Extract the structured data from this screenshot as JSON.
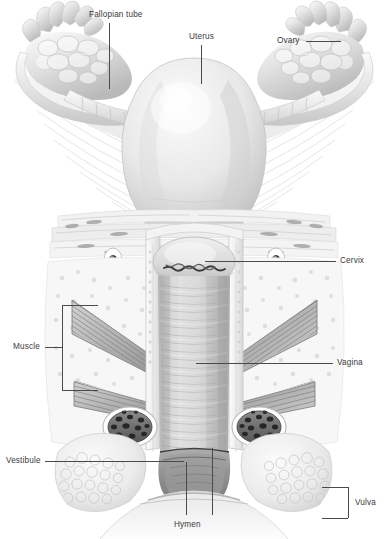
{
  "figure": {
    "style": "grayscale medical illustration",
    "background_color": "#ffffff",
    "label_color": "#3a3a3a",
    "leader_color": "#4a4a4a",
    "width": 389,
    "height": 539
  },
  "labels": [
    {
      "id": "fallopian-tube",
      "text": "Fallopian tube",
      "x": 89,
      "y": 11,
      "anchor": "left",
      "leader": "vertical-down"
    },
    {
      "id": "uterus",
      "text": "Uterus",
      "x": 189,
      "y": 33,
      "anchor": "left",
      "leader": "vertical-down"
    },
    {
      "id": "ovary",
      "text": "Ovary",
      "x": 277,
      "y": 37,
      "anchor": "left",
      "leader": "horizontal-right"
    },
    {
      "id": "cervix",
      "text": "Cervix",
      "x": 340,
      "y": 257,
      "anchor": "left",
      "leader": "horizontal-left"
    },
    {
      "id": "muscle",
      "text": "Muscle",
      "x": 13,
      "y": 343,
      "anchor": "left",
      "leader": "bracket-right"
    },
    {
      "id": "vagina",
      "text": "Vagina",
      "x": 337,
      "y": 359,
      "anchor": "left",
      "leader": "horizontal-left"
    },
    {
      "id": "vestibule",
      "text": "Vestibule",
      "x": 6,
      "y": 457,
      "anchor": "left",
      "leader": "horizontal-right"
    },
    {
      "id": "vulva",
      "text": "Vulva",
      "x": 355,
      "y": 499,
      "anchor": "left",
      "leader": "bracket-left"
    },
    {
      "id": "hymen",
      "text": "Hymen",
      "x": 174,
      "y": 521,
      "anchor": "left",
      "leader": "two-verticals-up"
    }
  ],
  "structures": [
    {
      "name": "left ovary",
      "region": "upper-left"
    },
    {
      "name": "right ovary",
      "region": "upper-right"
    },
    {
      "name": "left fallopian tube",
      "region": "upper-left"
    },
    {
      "name": "right fallopian tube",
      "region": "upper-right"
    },
    {
      "name": "uterine fundus",
      "region": "upper-center"
    },
    {
      "name": "broad ligament",
      "region": "upper"
    },
    {
      "name": "cervix with os",
      "region": "middle-center"
    },
    {
      "name": "vaginal canal with rugae",
      "region": "center"
    },
    {
      "name": "pelvic floor muscle",
      "region": "middle-left-and-right"
    },
    {
      "name": "vestibular bulb",
      "region": "lower-left-and-right"
    },
    {
      "name": "labial fat pad",
      "region": "lower-left-and-right"
    },
    {
      "name": "vestibule",
      "region": "lower-center"
    },
    {
      "name": "hymen",
      "region": "lower-center"
    }
  ]
}
